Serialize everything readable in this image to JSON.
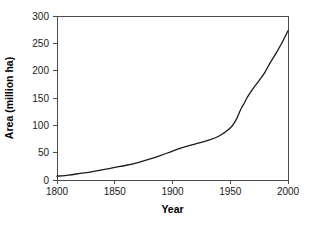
{
  "chart_data": {
    "type": "line",
    "title": "",
    "xlabel": "Year",
    "ylabel": "Area (million ha)",
    "xlim": [
      1800,
      2000
    ],
    "ylim": [
      0,
      300
    ],
    "xticks": [
      1800,
      1850,
      1900,
      1950,
      2000
    ],
    "yticks": [
      0,
      50,
      100,
      150,
      200,
      250,
      300
    ],
    "xtick_labels": [
      "1800",
      "1850",
      "1900",
      "1950",
      "2000"
    ],
    "ytick_labels": [
      "0",
      "50",
      "100",
      "150",
      "200",
      "250",
      "300"
    ],
    "grid": false,
    "legend": null,
    "line_color": "#1a1a1a",
    "axis_color": "#4c4c4c",
    "background_color": "#ffffff",
    "series": [
      {
        "name": "Irrigated area",
        "x": [
          1800,
          1810,
          1820,
          1830,
          1840,
          1850,
          1860,
          1870,
          1880,
          1890,
          1900,
          1910,
          1920,
          1930,
          1940,
          1950,
          1955,
          1958,
          1960,
          1962,
          1965,
          1970,
          1975,
          1980,
          1985,
          1988,
          1990,
          1995,
          2000
        ],
        "y": [
          7,
          9,
          12,
          15,
          19,
          23,
          27,
          32,
          38,
          45,
          53,
          60,
          66,
          72,
          80,
          95,
          110,
          124,
          133,
          140,
          152,
          168,
          182,
          197,
          216,
          226,
          233,
          252,
          273
        ]
      }
    ]
  },
  "axis_titles": {
    "x": "Year",
    "y": "Area (million ha)"
  }
}
